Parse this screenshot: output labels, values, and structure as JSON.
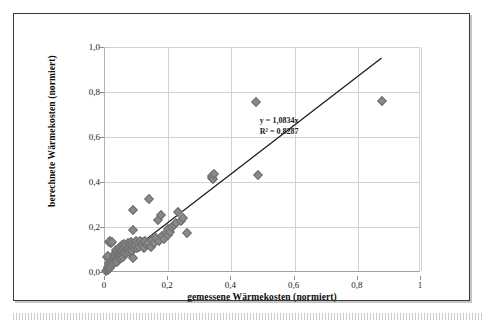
{
  "chart_data": {
    "type": "scatter",
    "title": "",
    "xlabel": "gemessene Wärmekosten (normiert)",
    "ylabel": "berechnete Wärmekosten (normiert)",
    "xlim": [
      0,
      1
    ],
    "ylim": [
      0,
      1
    ],
    "grid": true,
    "legend": null,
    "x_ticks": [
      "0",
      "0,2",
      "0,4",
      "0,6",
      "0,8",
      "1"
    ],
    "x_tick_values": [
      0,
      0.2,
      0.4,
      0.6,
      0.8,
      1.0
    ],
    "y_ticks": [
      "0,0",
      "0,2",
      "0,4",
      "0,6",
      "0,8",
      "1,0"
    ],
    "y_tick_values": [
      0,
      0.2,
      0.4,
      0.6,
      0.8,
      1.0
    ],
    "marker": {
      "shape": "diamond",
      "color": "#8a8a8a",
      "edge_color": "#6d6d6d",
      "size_px": 5
    },
    "annotations": [
      {
        "text": "y = 1,0834x",
        "x": 0.49,
        "y": 0.665
      },
      {
        "text": "R² = 0,8287",
        "x": 0.49,
        "y": 0.625
      }
    ],
    "trendline": {
      "type": "linear-through-origin",
      "equation": "y = 1,0834x",
      "slope": 1.0834,
      "intercept": 0,
      "r_squared": 0.8287,
      "color": "#1a1a1a",
      "x_start": 0.0,
      "y_start": 0.0,
      "x_end": 0.878,
      "y_end": 0.951
    },
    "series": [
      {
        "name": "Wärmekosten",
        "points": [
          [
            0.004,
            0.005
          ],
          [
            0.006,
            0.01
          ],
          [
            0.008,
            0.008
          ],
          [
            0.009,
            0.018
          ],
          [
            0.01,
            0.012
          ],
          [
            0.011,
            0.022
          ],
          [
            0.012,
            0.03
          ],
          [
            0.013,
            0.016
          ],
          [
            0.014,
            0.038
          ],
          [
            0.015,
            0.025
          ],
          [
            0.016,
            0.045
          ],
          [
            0.017,
            0.02
          ],
          [
            0.018,
            0.055
          ],
          [
            0.019,
            0.033
          ],
          [
            0.02,
            0.028
          ],
          [
            0.021,
            0.06
          ],
          [
            0.022,
            0.042
          ],
          [
            0.023,
            0.035
          ],
          [
            0.024,
            0.068
          ],
          [
            0.025,
            0.05
          ],
          [
            0.006,
            0.068
          ],
          [
            0.01,
            0.07
          ],
          [
            0.014,
            0.135
          ],
          [
            0.016,
            0.14
          ],
          [
            0.018,
            0.128
          ],
          [
            0.022,
            0.132
          ],
          [
            0.026,
            0.058
          ],
          [
            0.027,
            0.075
          ],
          [
            0.028,
            0.04
          ],
          [
            0.03,
            0.065
          ],
          [
            0.031,
            0.082
          ],
          [
            0.032,
            0.048
          ],
          [
            0.033,
            0.072
          ],
          [
            0.034,
            0.09
          ],
          [
            0.035,
            0.055
          ],
          [
            0.036,
            0.1
          ],
          [
            0.037,
            0.062
          ],
          [
            0.038,
            0.078
          ],
          [
            0.039,
            0.044
          ],
          [
            0.04,
            0.085
          ],
          [
            0.041,
            0.095
          ],
          [
            0.042,
            0.07
          ],
          [
            0.043,
            0.058
          ],
          [
            0.044,
            0.105
          ],
          [
            0.045,
            0.08
          ],
          [
            0.046,
            0.066
          ],
          [
            0.047,
            0.092
          ],
          [
            0.048,
            0.11
          ],
          [
            0.049,
            0.075
          ],
          [
            0.05,
            0.088
          ],
          [
            0.051,
            0.062
          ],
          [
            0.052,
            0.1
          ],
          [
            0.053,
            0.118
          ],
          [
            0.054,
            0.072
          ],
          [
            0.055,
            0.095
          ],
          [
            0.056,
            0.082
          ],
          [
            0.057,
            0.108
          ],
          [
            0.058,
            0.068
          ],
          [
            0.059,
            0.125
          ],
          [
            0.06,
            0.09
          ],
          [
            0.062,
            0.078
          ],
          [
            0.064,
            0.112
          ],
          [
            0.065,
            0.098
          ],
          [
            0.066,
            0.085
          ],
          [
            0.068,
            0.12
          ],
          [
            0.07,
            0.104
          ],
          [
            0.072,
            0.092
          ],
          [
            0.074,
            0.13
          ],
          [
            0.075,
            0.11
          ],
          [
            0.076,
            0.088
          ],
          [
            0.078,
            0.118
          ],
          [
            0.08,
            0.1
          ],
          [
            0.082,
            0.135
          ],
          [
            0.084,
            0.112
          ],
          [
            0.085,
            0.095
          ],
          [
            0.086,
            0.125
          ],
          [
            0.088,
            0.186
          ],
          [
            0.088,
            0.062
          ],
          [
            0.09,
            0.277
          ],
          [
            0.092,
            0.108
          ],
          [
            0.094,
            0.13
          ],
          [
            0.096,
            0.118
          ],
          [
            0.098,
            0.14
          ],
          [
            0.1,
            0.105
          ],
          [
            0.104,
            0.128
          ],
          [
            0.108,
            0.112
          ],
          [
            0.112,
            0.14
          ],
          [
            0.116,
            0.12
          ],
          [
            0.12,
            0.132
          ],
          [
            0.124,
            0.108
          ],
          [
            0.128,
            0.138
          ],
          [
            0.132,
            0.118
          ],
          [
            0.136,
            0.128
          ],
          [
            0.14,
            0.326
          ],
          [
            0.144,
            0.112
          ],
          [
            0.15,
            0.142
          ],
          [
            0.156,
            0.13
          ],
          [
            0.162,
            0.152
          ],
          [
            0.168,
            0.232
          ],
          [
            0.172,
            0.138
          ],
          [
            0.176,
            0.254
          ],
          [
            0.18,
            0.16
          ],
          [
            0.186,
            0.145
          ],
          [
            0.192,
            0.172
          ],
          [
            0.198,
            0.165
          ],
          [
            0.2,
            0.19
          ],
          [
            0.205,
            0.178
          ],
          [
            0.212,
            0.2
          ],
          [
            0.218,
            0.208
          ],
          [
            0.225,
            0.218
          ],
          [
            0.232,
            0.268
          ],
          [
            0.24,
            0.228
          ],
          [
            0.248,
            0.238
          ],
          [
            0.26,
            0.174
          ],
          [
            0.338,
            0.42
          ],
          [
            0.34,
            0.428
          ],
          [
            0.342,
            0.412
          ],
          [
            0.344,
            0.434
          ],
          [
            0.478,
            0.755
          ],
          [
            0.483,
            0.43
          ],
          [
            0.878,
            0.762
          ]
        ]
      }
    ]
  }
}
